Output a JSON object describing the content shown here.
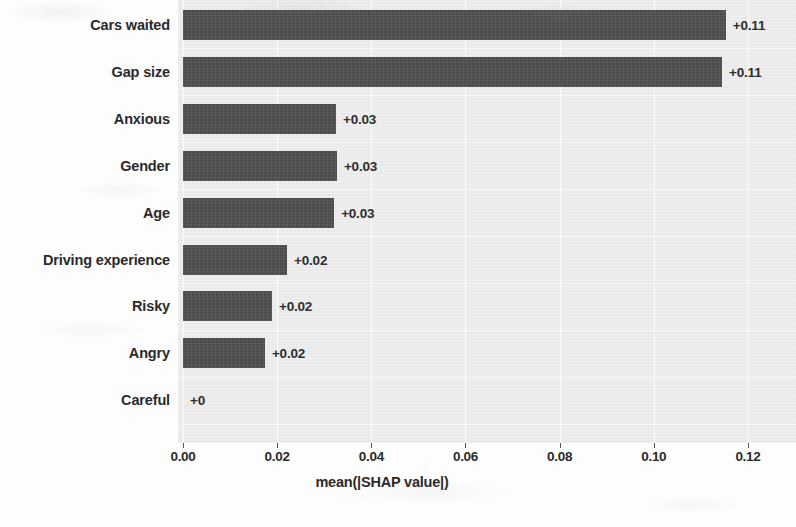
{
  "chart_data": {
    "type": "bar",
    "orientation": "horizontal",
    "title": "",
    "xlabel": "mean(|SHAP value|)",
    "ylabel": "",
    "xlim": [
      0,
      0.1302
    ],
    "xticks": [
      0.0,
      0.02,
      0.04,
      0.06,
      0.08,
      0.1,
      0.12
    ],
    "xticklabels": [
      "0.00",
      "0.02",
      "0.04",
      "0.06",
      "0.08",
      "0.10",
      "0.12"
    ],
    "categories": [
      "Cars waited",
      "Gap size",
      "Anxious",
      "Gender",
      "Age",
      "Driving experience",
      "Risky",
      "Angry",
      "Careful"
    ],
    "values": [
      0.1153,
      0.1145,
      0.0325,
      0.0327,
      0.0321,
      0.0221,
      0.0189,
      0.0174,
      0.0
    ],
    "value_labels": [
      "+0.11",
      "+0.11",
      "+0.03",
      "+0.03",
      "+0.03",
      "+0.02",
      "+0.02",
      "+0.02",
      "+0"
    ],
    "grid": true,
    "legend": false,
    "colors": {
      "bar": "#4d4d4d",
      "plot_background": "#e9e9e9",
      "figure_background": "#fdfdfd",
      "text": "#2a2a2a",
      "gridline": "#ffffff"
    }
  }
}
